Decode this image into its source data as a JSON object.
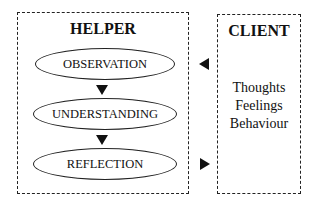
{
  "helper": {
    "title": "HELPER",
    "stages": [
      {
        "label": "OBSERVATION"
      },
      {
        "label": "UNDERSTANDING"
      },
      {
        "label": "REFLECTION"
      }
    ]
  },
  "client": {
    "title": "CLIENT",
    "items": [
      "Thoughts",
      "Feelings",
      "Behaviour"
    ]
  }
}
